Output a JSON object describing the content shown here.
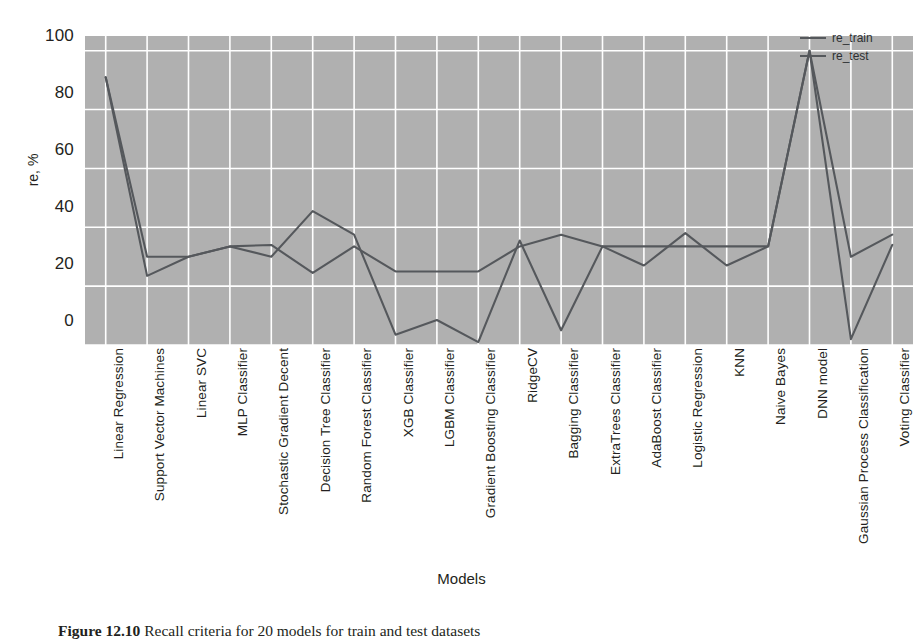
{
  "figure": {
    "caption_label": "Figure 12.10",
    "caption_text": "Recall criteria for 20 models for train and test datasets"
  },
  "legend": {
    "position": "top-right",
    "entries": [
      {
        "label": "re_train",
        "color": "#55585c"
      },
      {
        "label": "re_test",
        "color": "#55585c"
      }
    ]
  },
  "chart_data": {
    "type": "line",
    "title": "",
    "xlabel": "Models",
    "ylabel": "re, %",
    "ylim": [
      0,
      105
    ],
    "yticks": [
      0,
      20,
      40,
      60,
      80,
      100
    ],
    "ytick_labels": [
      "0",
      "20",
      "40",
      "60",
      "80",
      "100"
    ],
    "grid": true,
    "grid_color": "#ffffff",
    "plot_bg": "#b0b0b0",
    "legend_position": "upper right",
    "categories": [
      "Linear Regression",
      "Support Vector Machines",
      "Linear SVC",
      "MLP Classifier",
      "Stochastic Gradient Decent",
      "Decision Tree Classifier",
      "Random Forest Classifier",
      "XGB Classifier",
      "LGBM Classifier",
      "Gradient Boosting Classifier",
      "RidgeCV",
      "Bagging Classifier",
      "ExtraTrees Classifier",
      "AdaBoost Classifier",
      "Logistic Regression",
      "KNN",
      "Naive Bayes",
      "DNN model",
      "Gaussian Process Classification",
      "Voting Classifier"
    ],
    "series": [
      {
        "name": "re_train",
        "color": "#55585c",
        "values": [
          91,
          30,
          30,
          33.5,
          34,
          24.5,
          33.5,
          25,
          25,
          25,
          33.5,
          37.5,
          33.5,
          33.5,
          33.5,
          33.5,
          33.5,
          100,
          30,
          37.5
        ]
      },
      {
        "name": "re_test",
        "color": "#55585c",
        "values": [
          91,
          23.5,
          30,
          33.5,
          30,
          45.5,
          37.5,
          3.5,
          8.5,
          1,
          35.5,
          5,
          33.5,
          27,
          38,
          27,
          33.5,
          100,
          2,
          34
        ]
      }
    ]
  },
  "axes": {
    "y_title": "re, %",
    "x_title": "Models"
  }
}
